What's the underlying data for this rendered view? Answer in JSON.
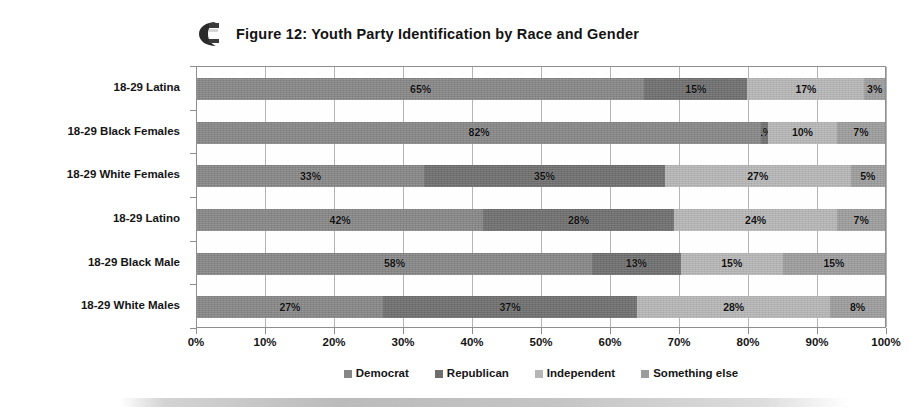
{
  "figure": {
    "logo_icon": "dark-swirl-logo-icon",
    "title": "Figure 12: Youth Party Identification by Race and Gender"
  },
  "chart_data": {
    "type": "bar",
    "orientation": "horizontal",
    "stacked": true,
    "normalized": true,
    "title": "Figure 12: Youth Party Identification by Race and Gender",
    "xlabel": "",
    "ylabel": "",
    "xlim": [
      0,
      100
    ],
    "xticks": [
      "0%",
      "10%",
      "20%",
      "30%",
      "40%",
      "50%",
      "60%",
      "70%",
      "80%",
      "90%",
      "100%"
    ],
    "grid": true,
    "legend_position": "bottom",
    "categories": [
      "18-29 Latina",
      "18-29 Black Females",
      "18-29 White Females",
      "18-29 Latino",
      "18-29 Black Male",
      "18-29 White Males"
    ],
    "series": [
      {
        "name": "Democrat",
        "color": "#868686",
        "values": [
          65,
          82,
          33,
          42,
          58,
          27
        ],
        "labels": [
          "65%",
          "82%",
          "33%",
          "42%",
          "58%",
          "27%"
        ]
      },
      {
        "name": "Republican",
        "color": "#6e6e6e",
        "values": [
          15,
          1,
          35,
          28,
          13,
          37
        ],
        "labels": [
          "15%",
          "1%",
          "35%",
          "28%",
          "13%",
          "37%"
        ]
      },
      {
        "name": "Independent",
        "color": "#b6b6b6",
        "values": [
          17,
          10,
          27,
          24,
          15,
          28
        ],
        "labels": [
          "17%",
          "10%",
          "27%",
          "24%",
          "15%",
          "28%"
        ]
      },
      {
        "name": "Something else",
        "color": "#9c9c9c",
        "values": [
          3,
          7,
          5,
          7,
          15,
          8
        ],
        "labels": [
          "3%",
          "7%",
          "5%",
          "7%",
          "15%",
          "8%"
        ]
      }
    ]
  }
}
